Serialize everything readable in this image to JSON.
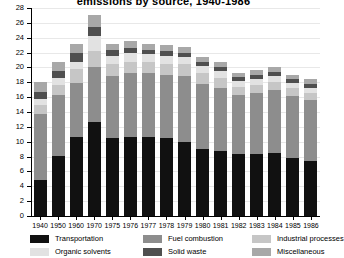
{
  "chart_data": {
    "type": "bar",
    "subtype": "stacked-vertical",
    "title": "emissions by source, 1940-1986",
    "xlabel": "",
    "ylabel": "",
    "ylim": [
      0,
      28
    ],
    "ytick_step": 2,
    "yticks": [
      0,
      2,
      4,
      6,
      8,
      10,
      12,
      14,
      16,
      18,
      20,
      22,
      24,
      26,
      28
    ],
    "grid": true,
    "legend_position": "bottom",
    "categories": [
      "1940",
      "1950",
      "1960",
      "1970",
      "1975",
      "1976",
      "1977",
      "1978",
      "1979",
      "1980",
      "1981",
      "1982",
      "1983",
      "1984",
      "1985",
      "1986"
    ],
    "series": [
      {
        "name": "Transportation",
        "color": "#111111",
        "values": [
          4.8,
          8.1,
          10.6,
          12.7,
          10.5,
          10.6,
          10.6,
          10.5,
          10.0,
          9.0,
          8.7,
          8.3,
          8.4,
          8.5,
          7.8,
          7.4
        ]
      },
      {
        "name": "Fuel combustion",
        "color": "#8d8d8d",
        "values": [
          8.9,
          8.2,
          7.3,
          7.3,
          8.3,
          8.6,
          8.6,
          8.5,
          8.9,
          8.8,
          8.5,
          8.0,
          8.2,
          8.4,
          8.3,
          8.2
        ]
      },
      {
        "name": "Industrial processes",
        "color": "#c6c6c6",
        "values": [
          1.3,
          1.4,
          1.9,
          2.2,
          1.6,
          1.6,
          1.5,
          1.5,
          1.5,
          1.5,
          1.4,
          1.1,
          1.1,
          1.2,
          1.1,
          1.0
        ]
      },
      {
        "name": "Organic solvents",
        "color": "#e2e2e2",
        "values": [
          0.8,
          0.9,
          1.0,
          2.1,
          1.2,
          1.1,
          1.1,
          1.1,
          1.0,
          0.9,
          0.9,
          0.8,
          0.8,
          0.8,
          0.7,
          0.7
        ]
      },
      {
        "name": "Solid waste",
        "color": "#4f4f4f",
        "values": [
          0.9,
          0.9,
          1.1,
          1.2,
          0.7,
          0.7,
          0.6,
          0.6,
          0.6,
          0.5,
          0.5,
          0.5,
          0.5,
          0.5,
          0.5,
          0.5
        ]
      },
      {
        "name": "Miscellaneous",
        "color": "#a8a8a8",
        "values": [
          1.3,
          1.2,
          1.3,
          1.5,
          0.9,
          0.9,
          0.8,
          0.8,
          0.8,
          0.7,
          0.7,
          0.6,
          0.6,
          0.6,
          0.6,
          0.6
        ]
      }
    ]
  },
  "legend": {
    "items": [
      {
        "label": "Transportation",
        "color": "#111111"
      },
      {
        "label": "Fuel combustion",
        "color": "#8d8d8d"
      },
      {
        "label": "Industrial processes",
        "color": "#c6c6c6"
      },
      {
        "label": "Organic solvents",
        "color": "#e2e2e2"
      },
      {
        "label": "Solid waste",
        "color": "#4f4f4f"
      },
      {
        "label": "Miscellaneous",
        "color": "#a8a8a8"
      }
    ]
  }
}
